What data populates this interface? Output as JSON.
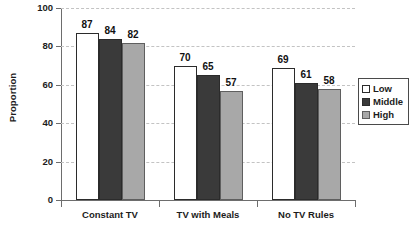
{
  "chart_data": {
    "type": "bar",
    "title": "",
    "xlabel": "",
    "ylabel": "Proportion",
    "ylim": [
      0,
      100
    ],
    "yticks": [
      0,
      20,
      40,
      60,
      80,
      100
    ],
    "ytick_labels": [
      "0",
      "20",
      "40",
      "60",
      "80",
      "100"
    ],
    "grid": true,
    "grid_style": "dashed horizontal",
    "legend_position": "right",
    "categories": [
      "Constant TV",
      "TV with Meals",
      "No TV Rules"
    ],
    "series": [
      {
        "name": "Low",
        "color": "#ffffff",
        "values": [
          87,
          70,
          69
        ],
        "labels": [
          "87",
          "70",
          "69"
        ]
      },
      {
        "name": "Middle",
        "color": "#3a3a3a",
        "values": [
          84,
          65,
          61
        ],
        "labels": [
          "84",
          "65",
          "61"
        ]
      },
      {
        "name": "High",
        "color": "#a8a8a8",
        "values": [
          82,
          57,
          58
        ],
        "labels": [
          "82",
          "57",
          "58"
        ]
      }
    ]
  },
  "legend": {
    "items": [
      {
        "label": "Low"
      },
      {
        "label": "Middle"
      },
      {
        "label": "High"
      }
    ]
  },
  "axes": {
    "y_title": "Proportion"
  }
}
